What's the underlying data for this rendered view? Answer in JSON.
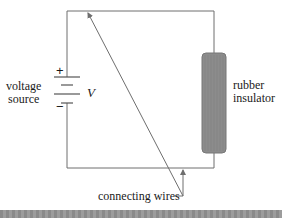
{
  "diagram": {
    "labels": {
      "voltage_source_line1": "voltage",
      "voltage_source_line2": "source",
      "voltage_symbol": "V",
      "plus_sign": "+",
      "minus_sign": "−",
      "insulator_line1": "rubber",
      "insulator_line2": "insulator",
      "connecting_wires": "connecting wires"
    },
    "colors": {
      "wire": "#6e6e6e",
      "insulator_fill": "#8c8c8c",
      "insulator_stroke": "#777777",
      "text": "#1a1a1a",
      "bottom_bar": "#939393"
    },
    "components": [
      {
        "type": "battery",
        "label": "voltage source",
        "symbol": "V"
      },
      {
        "type": "insulator",
        "label": "rubber insulator"
      },
      {
        "type": "wires",
        "label": "connecting wires"
      }
    ]
  }
}
